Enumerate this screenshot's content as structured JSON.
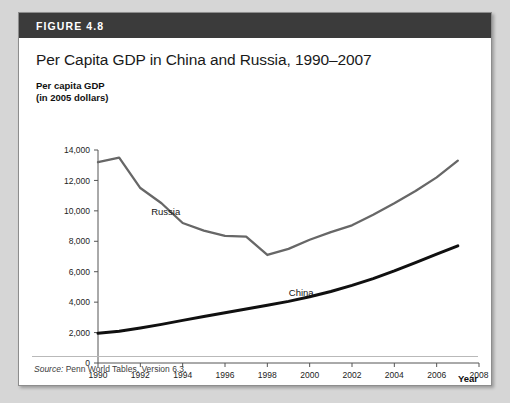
{
  "figure": {
    "number_label": "FIGURE 4.8",
    "title": "Per Capita GDP in China and Russia, 1990–2007",
    "y_axis_caption_line1": "Per capita GDP",
    "y_axis_caption_line2": "(in 2005 dollars)",
    "source_prefix": "Source:",
    "source_text": " Penn World Tables, Version 6.3."
  },
  "chart_data": {
    "type": "line",
    "title": "Per Capita GDP in China and Russia, 1990–2007",
    "xlabel": "Year",
    "ylabel": "Per capita GDP (in 2005 dollars)",
    "xlim": [
      1990,
      2008
    ],
    "ylim": [
      0,
      14000
    ],
    "xticks": [
      1990,
      1992,
      1994,
      1996,
      1998,
      2000,
      2002,
      2004,
      2006,
      2008
    ],
    "xtick_labels": [
      "1990",
      "1992",
      "1994",
      "1996",
      "1998",
      "2000",
      "2002",
      "2004",
      "2006",
      "2008"
    ],
    "yticks": [
      0,
      2000,
      4000,
      6000,
      8000,
      10000,
      12000,
      14000
    ],
    "ytick_labels": [
      "0",
      "2,000",
      "4,000",
      "6,000",
      "8,000",
      "10,000",
      "12,000",
      "14,000"
    ],
    "grid": false,
    "legend": "inline-labels",
    "x": [
      1990,
      1991,
      1992,
      1993,
      1994,
      1995,
      1996,
      1997,
      1998,
      1999,
      2000,
      2001,
      2002,
      2003,
      2004,
      2005,
      2006,
      2007
    ],
    "series": [
      {
        "name": "Russia",
        "color": "#676767",
        "label_x": 1993.2,
        "label_y": 9700,
        "values": [
          13200,
          13500,
          11500,
          10500,
          9200,
          8700,
          8350,
          8300,
          7100,
          7500,
          8100,
          8600,
          9050,
          9750,
          10500,
          11300,
          12200,
          13300
        ]
      },
      {
        "name": "China",
        "color": "#101010",
        "label_x": 1999.6,
        "label_y": 4400,
        "values": [
          1950,
          2080,
          2300,
          2540,
          2800,
          3050,
          3300,
          3550,
          3800,
          4050,
          4350,
          4700,
          5100,
          5550,
          6050,
          6600,
          7150,
          7700
        ]
      }
    ]
  },
  "axes": {
    "x_axis_title": "Year"
  }
}
